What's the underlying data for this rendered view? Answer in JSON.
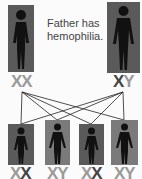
{
  "caption": {
    "line1": "Father has",
    "line2": "hemophilia."
  },
  "parents": [
    {
      "role": "mother",
      "alleles": [
        "X",
        "X"
      ],
      "affected": [
        false,
        false
      ]
    },
    {
      "role": "father",
      "alleles": [
        "X",
        "Y"
      ],
      "affected": [
        true,
        false
      ]
    }
  ],
  "children": [
    {
      "alleles": [
        "X",
        "X"
      ],
      "affected": [
        false,
        true
      ]
    },
    {
      "alleles": [
        "X",
        "Y"
      ],
      "affected": [
        false,
        false
      ]
    },
    {
      "alleles": [
        "X",
        "X"
      ],
      "affected": [
        false,
        true
      ]
    },
    {
      "alleles": [
        "X",
        "Y"
      ],
      "affected": [
        false,
        false
      ]
    }
  ],
  "colors": {
    "normal": "#9a9a9a",
    "affected": "#444444",
    "box_dark": "#5a5a5a",
    "box_light": "#7a7a7a"
  }
}
